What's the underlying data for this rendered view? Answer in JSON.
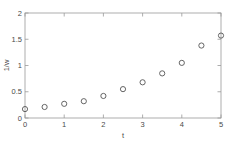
{
  "chart_data": {
    "type": "scatter",
    "title": "",
    "xlabel": "t",
    "ylabel": "1/w",
    "xlim": [
      0,
      5
    ],
    "ylim": [
      0,
      2
    ],
    "grid": false,
    "legend": null,
    "marker": "open-circle",
    "marker_color": "#555555",
    "x": [
      0,
      0.5,
      1,
      1.5,
      2,
      2.5,
      3,
      3.5,
      4,
      4.5,
      5
    ],
    "values": [
      0.17,
      0.21,
      0.27,
      0.32,
      0.42,
      0.55,
      0.68,
      0.85,
      1.05,
      1.38,
      1.57
    ],
    "series": [
      {
        "name": "1/w",
        "values": [
          0.17,
          0.21,
          0.27,
          0.32,
          0.42,
          0.55,
          0.68,
          0.85,
          1.05,
          1.38,
          1.57
        ]
      }
    ],
    "xticks": [
      0,
      1,
      2,
      3,
      4,
      5
    ],
    "xticklabels": [
      "0",
      "1",
      "2",
      "3",
      "4",
      "5"
    ],
    "yticks": [
      0,
      0.5,
      1,
      1.5,
      2
    ],
    "yticklabels": [
      "0",
      "0.5",
      "1",
      "1.5",
      "2"
    ],
    "axis_color": "#999999",
    "text_color": "#4a4a4a",
    "background": "#ffffff"
  }
}
